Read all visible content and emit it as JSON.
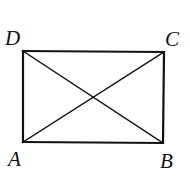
{
  "diagram": {
    "type": "rectangle-with-diagonals",
    "stroke_color": "#111111",
    "background": "#ffffff",
    "vertices": {
      "A": {
        "label": "A",
        "x": 23,
        "y": 142
      },
      "B": {
        "label": "B",
        "x": 163,
        "y": 143
      },
      "C": {
        "label": "C",
        "x": 164,
        "y": 52
      },
      "D": {
        "label": "D",
        "x": 23,
        "y": 51
      }
    },
    "edges": [
      "AB",
      "BC",
      "CD",
      "DA"
    ],
    "diagonals": [
      "AC",
      "BD"
    ],
    "labels": {
      "A": "A",
      "B": "B",
      "C": "C",
      "D": "D"
    }
  }
}
